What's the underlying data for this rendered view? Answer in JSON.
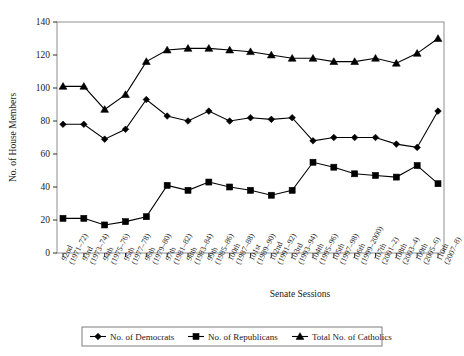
{
  "chart_data": {
    "type": "line",
    "title": "",
    "xlabel": "Senate Sessions",
    "ylabel": "No. of House Members",
    "ylim": [
      0,
      140
    ],
    "yticks": [
      0,
      20,
      40,
      60,
      80,
      100,
      120,
      140
    ],
    "grid": false,
    "legend_position": "bottom",
    "categories": [
      "92nd\n(1971–72)",
      "93rd\n(1973–74)",
      "94th\n(1975–76)",
      "95th\n(1977–78)",
      "96th\n(1979–80)",
      "97th\n(1981–82)",
      "98th\n(1983–84)",
      "99th\n(1985–86)",
      "100th\n(1987–88)",
      "101st\n(1989–90)",
      "102nd\n(1991–92)",
      "103rd\n(1993–94)",
      "104th\n(1995–96)",
      "105th\n(1997–98)",
      "106th\n(1999–2000)",
      "107th\n(2001–2)",
      "108th\n(2003–4)",
      "109th\n(2005–6)",
      "110th\n(2007–8)"
    ],
    "series": [
      {
        "name": "No. of Democrats",
        "marker": "diamond",
        "values": [
          78,
          78,
          69,
          75,
          93,
          83,
          80,
          86,
          80,
          82,
          81,
          82,
          68,
          70,
          70,
          70,
          66,
          64,
          86
        ]
      },
      {
        "name": "No. of Republicans",
        "marker": "square",
        "values": [
          21,
          21,
          17,
          19,
          22,
          41,
          38,
          43,
          40,
          38,
          35,
          38,
          55,
          52,
          48,
          47,
          46,
          53,
          42
        ]
      },
      {
        "name": "Total No. of Catholics",
        "marker": "triangle",
        "values": [
          101,
          101,
          87,
          96,
          116,
          123,
          124,
          124,
          123,
          122,
          120,
          118,
          118,
          116,
          116,
          118,
          115,
          121,
          130
        ]
      }
    ]
  },
  "legend": {
    "items": [
      {
        "label": "No. of Democrats",
        "marker": "diamond"
      },
      {
        "label": "No. of Republicans",
        "marker": "square"
      },
      {
        "label": "Total No. of Catholics",
        "marker": "triangle"
      }
    ]
  }
}
